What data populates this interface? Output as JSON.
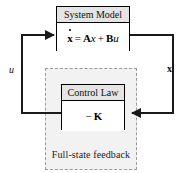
{
  "diagram": {
    "background_color": "#ffffff",
    "line_color": "#1a1a1a",
    "group_fill_color": "#f2f2f2",
    "group_border_color": "#9a9a9a",
    "block_header_fill": "#e4e4e4",
    "block_border_color": "#000000"
  },
  "blocks": {
    "system_model": {
      "title": "System Model",
      "equation": {
        "lhs": "x",
        "lhs_accent": "dot",
        "equals": "=",
        "term1_matrix": "A",
        "term1_vector": "x",
        "plus": "+",
        "term2_matrix": "B",
        "term2_scalar": "u",
        "text": "ẋ = Ax + Bu"
      }
    },
    "control_law": {
      "title": "Control Law",
      "expression": {
        "sign": "−",
        "gain": "K",
        "text": "− K"
      }
    }
  },
  "group": {
    "caption": "Full-state feedback"
  },
  "signals": {
    "input": {
      "label": "u",
      "style": "italic",
      "description": "control input into System Model"
    },
    "state": {
      "label": "x",
      "style": "bold",
      "description": "state vector fed back to Control Law"
    }
  },
  "connections": [
    {
      "name": "state-feedback-path",
      "from": "system_model_output_right",
      "to": "control_law_input_right",
      "arrow": "left"
    },
    {
      "name": "control-input-path",
      "from": "control_law_output_left",
      "to": "system_model_input_left",
      "arrow": "right"
    }
  ]
}
